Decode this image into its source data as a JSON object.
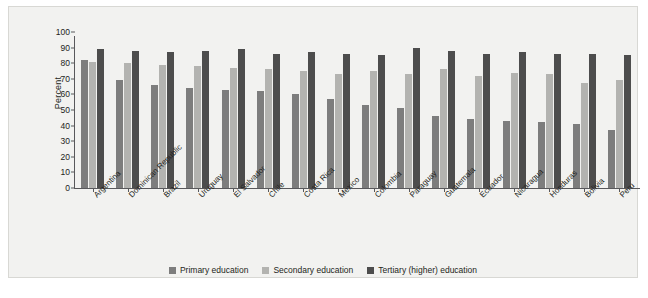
{
  "chart_data": {
    "type": "bar",
    "title": "",
    "subtitle": "",
    "xlabel": "",
    "ylabel": "Percent",
    "ylim": [
      0,
      100
    ],
    "yticks": [
      0,
      10,
      20,
      30,
      40,
      50,
      60,
      70,
      80,
      90,
      100
    ],
    "grid": false,
    "legend_position": "bottom-center",
    "categories": [
      "Argentina",
      "Dominican Republic",
      "Brazil",
      "Uruguay",
      "El Salvador",
      "Chile",
      "Costa Rica",
      "Mexico",
      "Colombia",
      "Paraguay",
      "Guatemala",
      "Ecuador",
      "Nicaragua",
      "Honduras",
      "Bolivia",
      "Peru"
    ],
    "series": [
      {
        "name": "Primary education",
        "color": "#7d7d7d",
        "values": [
          82,
          69,
          66,
          64,
          63,
          62,
          60,
          57,
          53,
          51,
          46,
          44,
          43,
          42,
          41,
          37
        ]
      },
      {
        "name": "Secondary education",
        "color": "#b3b3b0",
        "values": [
          81,
          80,
          79,
          78,
          77,
          76,
          75,
          73,
          75,
          73,
          76,
          72,
          74,
          73,
          67,
          69
        ]
      },
      {
        "name": "Tertiary (higher) education",
        "color": "#4d4d4d",
        "values": [
          89,
          88,
          87,
          88,
          89,
          86,
          87,
          86,
          85,
          90,
          88,
          86,
          87,
          86,
          86,
          85
        ]
      }
    ]
  },
  "legend": {
    "items": [
      {
        "label": "Primary education",
        "key": "primary"
      },
      {
        "label": "Secondary education",
        "key": "secondary"
      },
      {
        "label": "Tertiary (higher) education",
        "key": "tertiary"
      }
    ]
  }
}
